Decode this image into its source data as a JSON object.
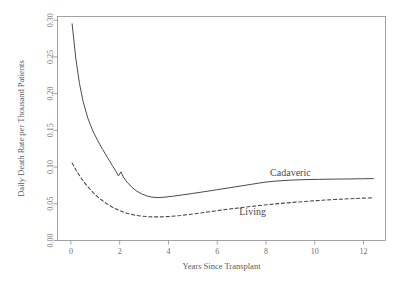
{
  "chart_data": {
    "type": "line",
    "title": "",
    "xlabel": "Years Since Transplant",
    "ylabel": "Daily Death Rate per Thousand Patients",
    "xlim": [
      -0.55,
      12.9
    ],
    "ylim": [
      0.0,
      0.305
    ],
    "grid": false,
    "legend_position": "inline-annotation",
    "xticks": [
      "0",
      "2",
      "4",
      "6",
      "8",
      "10",
      "12"
    ],
    "xtick_values": [
      0,
      2,
      4,
      6,
      8,
      10,
      12
    ],
    "yticks": [
      "0.00",
      "0.05",
      "0.10",
      "0.15",
      "0.20",
      "0.25",
      "0.30"
    ],
    "ytick_values": [
      0.0,
      0.05,
      0.1,
      0.15,
      0.2,
      0.25,
      0.3
    ],
    "series": [
      {
        "name": "Cadaveric",
        "style": "solid",
        "color": "#4a4a4a",
        "label_x": 9.0,
        "label_y": 0.088,
        "x": [
          0.05,
          0.2,
          0.35,
          0.5,
          0.7,
          0.9,
          1.1,
          1.3,
          1.5,
          1.7,
          1.85,
          1.95,
          2.05,
          2.15,
          2.3,
          2.5,
          2.7,
          2.9,
          3.1,
          3.3,
          3.5,
          3.7,
          3.9,
          4.2,
          4.6,
          5.0,
          5.5,
          6.0,
          6.5,
          7.0,
          7.4,
          7.7,
          8.0,
          8.4,
          9.0,
          9.6,
          10.2,
          10.8,
          11.4,
          12.0,
          12.4
        ],
        "y": [
          0.295,
          0.248,
          0.214,
          0.189,
          0.166,
          0.149,
          0.136,
          0.124,
          0.113,
          0.102,
          0.094,
          0.088,
          0.0935,
          0.0865,
          0.0795,
          0.0725,
          0.0672,
          0.0635,
          0.0608,
          0.0592,
          0.0585,
          0.0586,
          0.0592,
          0.0604,
          0.0622,
          0.0641,
          0.0666,
          0.0692,
          0.0718,
          0.0744,
          0.0765,
          0.0781,
          0.0796,
          0.0809,
          0.0822,
          0.0829,
          0.0833,
          0.0836,
          0.0838,
          0.0841,
          0.0843
        ]
      },
      {
        "name": "Living",
        "style": "dashed",
        "color": "#4a4a4a",
        "label_x": 7.45,
        "label_y": 0.035,
        "x": [
          0.05,
          0.25,
          0.45,
          0.65,
          0.9,
          1.15,
          1.4,
          1.7,
          2.0,
          2.3,
          2.6,
          2.9,
          3.2,
          3.5,
          3.8,
          4.1,
          4.5,
          5.0,
          5.5,
          6.0,
          6.5,
          7.0,
          7.5,
          8.0,
          8.5,
          9.0,
          9.6,
          10.2,
          10.8,
          11.4,
          12.0,
          12.4
        ],
        "y": [
          0.1055,
          0.0935,
          0.0835,
          0.0748,
          0.0655,
          0.0578,
          0.0516,
          0.0454,
          0.0406,
          0.0371,
          0.0346,
          0.0331,
          0.0323,
          0.0321,
          0.0323,
          0.0329,
          0.0341,
          0.0361,
          0.0383,
          0.0406,
          0.0428,
          0.0449,
          0.0468,
          0.0486,
          0.0502,
          0.0516,
          0.0532,
          0.0546,
          0.0558,
          0.0568,
          0.0577,
          0.0582
        ]
      }
    ]
  }
}
